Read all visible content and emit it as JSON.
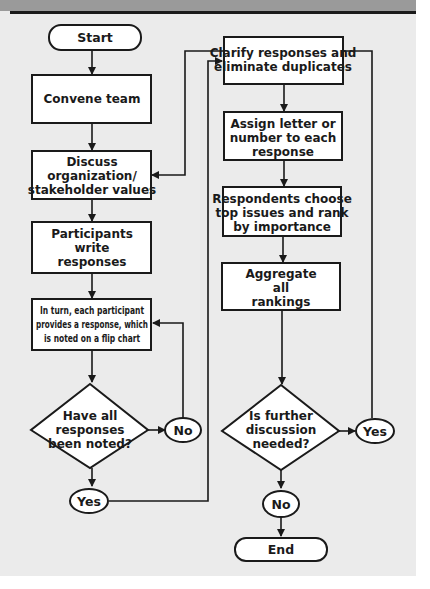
{
  "colors": {
    "background": "#ebebeb",
    "header_band": "#9a9a9a",
    "stroke": "#1a1a1a",
    "node_fill": "#ffffff"
  },
  "nodes": {
    "start": {
      "type": "terminal",
      "label": "Start"
    },
    "convene": {
      "type": "process",
      "label": "Convene team"
    },
    "discuss": {
      "type": "process",
      "lines": [
        "Discuss",
        "organization/",
        "stakeholder values"
      ]
    },
    "write": {
      "type": "process",
      "lines": [
        "Participants",
        "write",
        "responses"
      ]
    },
    "inturn": {
      "type": "process",
      "lines": [
        "In turn, each participant",
        "provides a response, which",
        "is noted on a flip chart"
      ]
    },
    "decision1": {
      "type": "decision",
      "lines": [
        "Have all",
        "responses",
        "been noted?"
      ]
    },
    "d1_no": {
      "type": "connector",
      "label": "No"
    },
    "d1_yes": {
      "type": "connector",
      "label": "Yes"
    },
    "clarify": {
      "type": "process",
      "lines": [
        "Clarify responses and",
        "eliminate duplicates"
      ]
    },
    "assign": {
      "type": "process",
      "lines": [
        "Assign letter or",
        "number to each",
        "response"
      ]
    },
    "rank": {
      "type": "process",
      "lines": [
        "Respondents choose",
        "top issues and rank",
        "by importance"
      ]
    },
    "aggregate": {
      "type": "process",
      "lines": [
        "Aggregate",
        "all",
        "rankings"
      ]
    },
    "decision2": {
      "type": "decision",
      "lines": [
        "Is further",
        "discussion",
        "needed?"
      ]
    },
    "d2_yes": {
      "type": "connector",
      "label": "Yes"
    },
    "d2_no": {
      "type": "connector",
      "label": "No"
    },
    "end": {
      "type": "terminal",
      "label": "End"
    }
  },
  "edges": [
    {
      "from": "start",
      "to": "convene"
    },
    {
      "from": "convene",
      "to": "discuss"
    },
    {
      "from": "discuss",
      "to": "write"
    },
    {
      "from": "write",
      "to": "inturn"
    },
    {
      "from": "inturn",
      "to": "decision1"
    },
    {
      "from": "decision1",
      "to": "d1_no"
    },
    {
      "from": "d1_no",
      "to": "inturn"
    },
    {
      "from": "decision1",
      "to": "d1_yes"
    },
    {
      "from": "d1_yes",
      "to": "clarify"
    },
    {
      "from": "clarify",
      "to": "assign"
    },
    {
      "from": "assign",
      "to": "rank"
    },
    {
      "from": "rank",
      "to": "aggregate"
    },
    {
      "from": "aggregate",
      "to": "decision2"
    },
    {
      "from": "decision2",
      "to": "d2_yes"
    },
    {
      "from": "d2_yes",
      "to": "discuss"
    },
    {
      "from": "decision2",
      "to": "d2_no"
    },
    {
      "from": "d2_no",
      "to": "end"
    }
  ]
}
